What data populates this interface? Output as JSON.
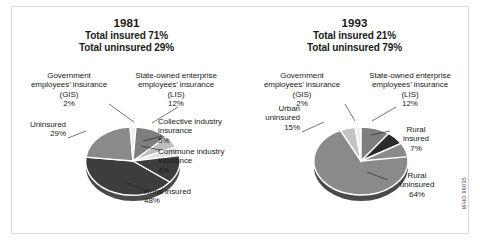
{
  "figure": {
    "top_crumb": "",
    "watermark": "WHO 99035"
  },
  "panels": [
    {
      "id": "1981",
      "year": "1981",
      "total_insured": "Total insured 71%",
      "total_uninsured": "Total uninsured 29%",
      "callouts": {
        "gis": "Government\nemployees’ insurance\n(GIS)\n2%",
        "lis": "State-owned enterprise\nemployees’ insurance\n(LIS)\n12%",
        "uninsured": "Uninsured\n29%",
        "collective": "Collective industry\ninsurance\n5%",
        "commune": "Commune industry\ninsurance\n4%",
        "rural_insured": "Rural insured\n48%"
      }
    },
    {
      "id": "1993",
      "year": "1993",
      "total_insured": "Total insured 21%",
      "total_uninsured": "Total uninsured 79%",
      "callouts": {
        "gis": "Government\nemployees’ insurance\n(GIS)\n2%",
        "lis": "State-owned enterprise\nemployees’ insurance\n(LIS)\n12%",
        "urban_uninsured": "Urban\nuninsured\n15%",
        "rural_insured": "Rural\ninsured\n7%",
        "rural_uninsured": "Rural\nuninsured\n64%"
      }
    }
  ],
  "chart_data": [
    {
      "type": "pie",
      "title": "1981",
      "subtitle": "Total insured 71% / Total uninsured 29%",
      "labels": [
        "Government employees’ insurance (GIS)",
        "State-owned enterprise employees’ insurance (LIS)",
        "Collective industry insurance",
        "Commune industry insurance",
        "Rural insured",
        "Uninsured"
      ],
      "values": [
        2,
        12,
        5,
        4,
        48,
        29
      ],
      "unit": "%",
      "colors": [
        "#e9e9e9",
        "#8d8d8d",
        "#bdbdbd",
        "#e0e0e0",
        "#404040",
        "#8d8d8d"
      ],
      "legend": "callouts",
      "grid": false
    },
    {
      "type": "pie",
      "title": "1993",
      "subtitle": "Total insured 21% / Total uninsured 79%",
      "labels": [
        "Government employees’ insurance (GIS)",
        "State-owned enterprise employees’ insurance (LIS)",
        "Rural insured",
        "Rural uninsured",
        "Urban uninsured"
      ],
      "values": [
        2,
        12,
        7,
        64,
        15
      ],
      "unit": "%",
      "colors": [
        "#e9e9e9",
        "#8d8d8d",
        "#2e2e2e",
        "#8d8d8d",
        "#c9c9c9"
      ],
      "legend": "callouts",
      "grid": false
    }
  ]
}
